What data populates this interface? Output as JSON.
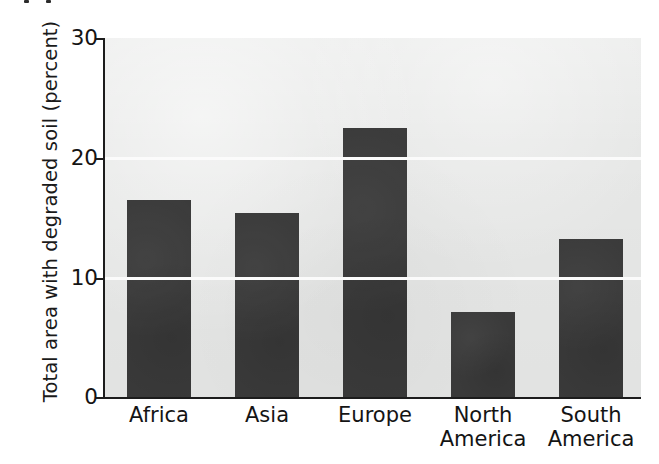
{
  "chart_data": {
    "type": "bar",
    "title": "",
    "subtitle": "",
    "xlabel": "",
    "ylabel": "Total area with degraded soil (percent)",
    "categories": [
      "Africa",
      "Asia",
      "Europe",
      "North America",
      "South America"
    ],
    "category_lines": [
      [
        "Africa"
      ],
      [
        "Asia"
      ],
      [
        "Europe"
      ],
      [
        "North",
        "America"
      ],
      [
        "South",
        "America"
      ]
    ],
    "values": [
      16.5,
      15.4,
      22.5,
      7.1,
      13.2
    ],
    "ylim": [
      0,
      30
    ],
    "ytick_values": [
      0,
      10,
      20,
      30
    ],
    "ytick_labels": [
      "0",
      "10",
      "20",
      "30"
    ],
    "grid": "horizontal-white-gridlines at 10 and 20",
    "legend": "none",
    "legend_position": "none",
    "annotations": [],
    "colors": {
      "bar": "#3a3a3a",
      "plot_background": "#e6e7e6",
      "figure_background": "#ffffff",
      "gridline": "#fbfbfb",
      "axis": "#1c1c1c",
      "text": "#141414"
    }
  }
}
